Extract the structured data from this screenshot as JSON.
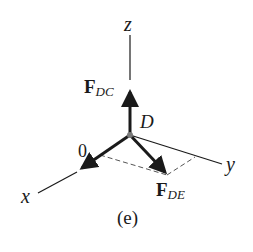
{
  "diagram": {
    "type": "free-body-diagram-3d",
    "caption": "(e)",
    "point": {
      "label": "D",
      "x": 130,
      "y": 135
    },
    "axes": [
      {
        "name": "z",
        "label": "z"
      },
      {
        "name": "y",
        "label": "y"
      },
      {
        "name": "x",
        "label": "x"
      }
    ],
    "forces": [
      {
        "name": "F_DC",
        "symbol": "F",
        "subscript": "DC",
        "direction": "+z"
      },
      {
        "name": "F_DE",
        "symbol": "F",
        "subscript": "DE",
        "direction": "in x-y plane"
      }
    ],
    "zero_force_label": "0",
    "colors": {
      "line": "#1a1a1a",
      "dashed": "#555555",
      "point": "#7a7a7a",
      "background": "#ffffff"
    }
  }
}
